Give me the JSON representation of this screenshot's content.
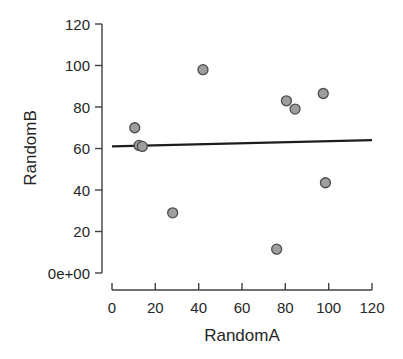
{
  "chart_data": {
    "type": "scatter",
    "title": "",
    "subtitle": "",
    "xlabel": "RandomA",
    "ylabel": "RandomB",
    "xlim": [
      0,
      120
    ],
    "ylim": [
      0,
      120
    ],
    "xticks": [
      0,
      20,
      40,
      60,
      80,
      100,
      120
    ],
    "xtick_labels": [
      "0",
      "20",
      "40",
      "60",
      "80",
      "100",
      "120"
    ],
    "yticks": [
      0,
      20,
      40,
      60,
      80,
      100,
      120
    ],
    "ytick_labels": [
      "0e+00",
      "20",
      "40",
      "60",
      "80",
      "100",
      "120"
    ],
    "grid": false,
    "legend": null,
    "marker": {
      "shape": "circle",
      "fill_color": "#9e9e9e",
      "edge_color": "#4d4d4d",
      "radius_px": 5
    },
    "points": [
      {
        "x": 10.5,
        "y": 70.0
      },
      {
        "x": 12.5,
        "y": 61.5
      },
      {
        "x": 14.0,
        "y": 61.0
      },
      {
        "x": 28.0,
        "y": 29.0
      },
      {
        "x": 42.0,
        "y": 98.0
      },
      {
        "x": 76.0,
        "y": 11.5
      },
      {
        "x": 80.5,
        "y": 83.0
      },
      {
        "x": 84.5,
        "y": 79.0
      },
      {
        "x": 97.5,
        "y": 86.5
      },
      {
        "x": 98.5,
        "y": 43.5
      }
    ],
    "series": [
      {
        "name": "RandomB vs RandomA",
        "type": "scatter",
        "values": [
          [
            10.5,
            70.0
          ],
          [
            12.5,
            61.5
          ],
          [
            14.0,
            61.0
          ],
          [
            28.0,
            29.0
          ],
          [
            42.0,
            98.0
          ],
          [
            76.0,
            11.5
          ],
          [
            80.5,
            83.0
          ],
          [
            84.5,
            79.0
          ],
          [
            97.5,
            86.5
          ],
          [
            98.5,
            43.5
          ]
        ]
      },
      {
        "name": "regression-line",
        "type": "line",
        "color": "#1c1c1c",
        "endpoints": [
          [
            0,
            61.0
          ],
          [
            120,
            64.0
          ]
        ]
      }
    ],
    "annotations": []
  },
  "axes": {
    "x_title": "RandomA",
    "y_title": "RandomB"
  }
}
